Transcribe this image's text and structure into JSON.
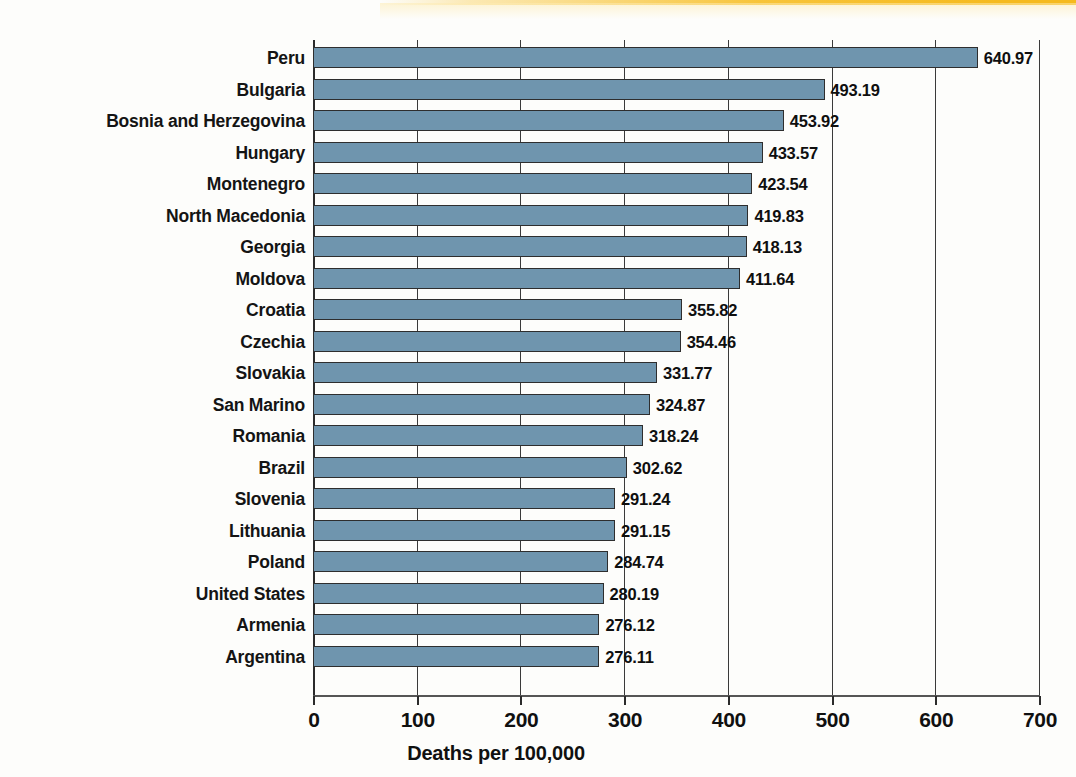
{
  "chart_data": {
    "type": "bar",
    "orientation": "horizontal",
    "title": "",
    "xlabel": "Deaths per 100,000",
    "ylabel": "",
    "xlim": [
      0,
      700
    ],
    "xticks": [
      0,
      100,
      200,
      300,
      400,
      500,
      600,
      700
    ],
    "xtick_labels": [
      "0",
      "100",
      "200",
      "300",
      "400",
      "500",
      "600",
      "700"
    ],
    "grid": true,
    "grid_axis": "x",
    "legend": false,
    "bar_color": "#6f95ae",
    "bar_edge_color": "#2e2e2e",
    "background_color": "#fdfdfb",
    "value_label_format": "2 decimals",
    "categories": [
      "Peru",
      "Bulgaria",
      "Bosnia and Herzegovina",
      "Hungary",
      "Montenegro",
      "North Macedonia",
      "Georgia",
      "Moldova",
      "Croatia",
      "Czechia",
      "Slovakia",
      "San Marino",
      "Romania",
      "Brazil",
      "Slovenia",
      "Lithuania",
      "Poland",
      "United States",
      "Armenia",
      "Argentina"
    ],
    "values": [
      640.97,
      493.19,
      453.92,
      433.57,
      423.54,
      419.83,
      418.13,
      411.64,
      355.82,
      354.46,
      331.77,
      324.87,
      318.24,
      302.62,
      291.24,
      291.15,
      284.74,
      280.19,
      276.12,
      276.11
    ],
    "value_labels": [
      "640.97",
      "493.19",
      "453.92",
      "433.57",
      "423.54",
      "419.83",
      "418.13",
      "411.64",
      "355.82",
      "354.46",
      "331.77",
      "324.87",
      "318.24",
      "302.62",
      "291.24",
      "291.15",
      "284.74",
      "280.19",
      "276.12",
      "276.11"
    ]
  }
}
